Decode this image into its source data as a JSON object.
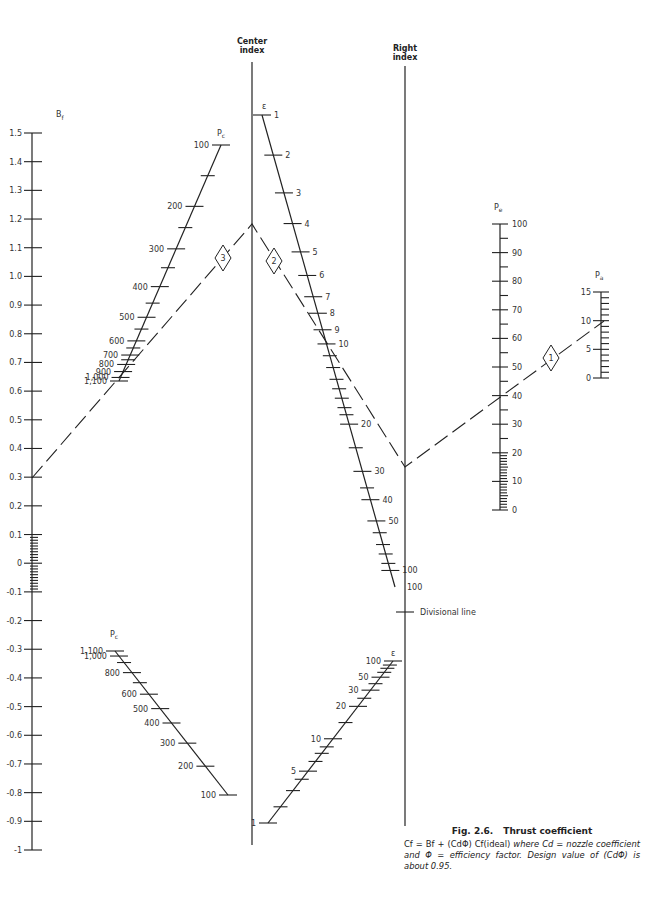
{
  "figure": {
    "number": "Fig. 2.6.",
    "title": "Thrust coefficient",
    "caption_formula": "Cf = Bf + (CdΦ) Cf(ideal)",
    "caption_text_1": "where",
    "caption_text_2": "Cd = nozzle coefficient and Φ = efficiency factor.",
    "caption_text_3": "Design value of (CdΦ) is about 0.95."
  },
  "chart_data": {
    "type": "nomogram",
    "title": "Thrust coefficient",
    "scales": [
      {
        "id": "Bf",
        "label": "Bf",
        "orientation": "vertical",
        "range": [
          -1,
          1.5
        ],
        "major_ticks": [
          "1.5",
          "1.4",
          "1.3",
          "1.2",
          "1.1",
          "1.0",
          "0.9",
          "0.8",
          "0.7",
          "0.6",
          "0.5",
          "0.4",
          "0.3",
          "0.2",
          "0.1",
          "0",
          "-0.1",
          "-0.2",
          "-0.3",
          "-0.4",
          "-0.5",
          "-0.6",
          "-0.7",
          "-0.8",
          "-0.9",
          "-1"
        ],
        "minor_ticks_between": [
          "0.1",
          "-0.1"
        ]
      },
      {
        "id": "Pc_upper",
        "label": "Pc",
        "orientation": "slanted",
        "ticks": [
          "100",
          "200",
          "300",
          "400",
          "500",
          "600",
          "700",
          "800",
          "900",
          "1,000",
          "1,100"
        ]
      },
      {
        "id": "Pc_lower",
        "label": "Pc",
        "orientation": "slanted",
        "ticks": [
          "1,100",
          "1,000",
          "800",
          "600",
          "500",
          "400",
          "300",
          "200",
          "100"
        ]
      },
      {
        "id": "center_index",
        "label": "Center index",
        "orientation": "vertical"
      },
      {
        "id": "eps_upper",
        "label": "ε",
        "orientation": "slanted",
        "ticks": [
          "1",
          "2",
          "3",
          "4",
          "5",
          "6",
          "7",
          "8",
          "9",
          "10",
          "20",
          "30",
          "40",
          "50",
          "100"
        ]
      },
      {
        "id": "right_index",
        "label": "Right index",
        "orientation": "vertical",
        "annotations": [
          "100",
          "Divisional line"
        ]
      },
      {
        "id": "eps_lower",
        "label": "ε",
        "orientation": "slanted",
        "ticks": [
          "1",
          "5",
          "10",
          "20",
          "30",
          "50",
          "100"
        ]
      },
      {
        "id": "Pe",
        "label": "Pe",
        "orientation": "vertical",
        "range": [
          0,
          100
        ],
        "ticks": [
          "100",
          "90",
          "80",
          "70",
          "60",
          "50",
          "40",
          "30",
          "20",
          "10",
          "0"
        ]
      },
      {
        "id": "Pa",
        "label": "Pa",
        "orientation": "vertical",
        "range": [
          0,
          15
        ],
        "ticks": [
          "15",
          "10",
          "5",
          "0"
        ]
      }
    ],
    "example_key": [
      {
        "step": "1",
        "connects": "Pa=10 to Pe=40, extended to Right index"
      },
      {
        "step": "2",
        "connects": "Right index through ε≈9 to Center index"
      },
      {
        "step": "3",
        "connects": "Center index through Pc≈700 to Bf=0.4"
      }
    ]
  },
  "labels": {
    "bf": "B",
    "bf_sub": "f",
    "pc": "P",
    "pc_sub": "c",
    "pe": "P",
    "pe_sub": "e",
    "pa": "P",
    "pa_sub": "a",
    "eps": "ε",
    "center_1": "Center",
    "center_2": "index",
    "right_1": "Right",
    "right_2": "index",
    "divisional": "Divisional line",
    "right_100": "100",
    "step1": "1",
    "step2": "2",
    "step3": "3"
  }
}
